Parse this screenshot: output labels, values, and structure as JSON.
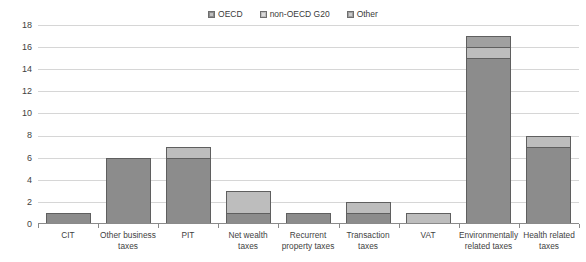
{
  "chart_data": {
    "type": "bar",
    "subtype": "stacked-vertical",
    "title": "",
    "xlabel": "",
    "ylabel": "",
    "ylim": [
      0,
      18
    ],
    "yticks": [
      0,
      2,
      4,
      6,
      8,
      10,
      12,
      14,
      16,
      18
    ],
    "grid": true,
    "legend_position": "top-center",
    "categories": [
      "CIT",
      "Other business taxes",
      "PIT",
      "Net wealth taxes",
      "Recurrent property taxes",
      "Transaction taxes",
      "VAT",
      "Environmentally related taxes",
      "Health related taxes"
    ],
    "series": [
      {
        "name": "OECD",
        "color": "#8c8c8c",
        "values": [
          1,
          6,
          6,
          1,
          1,
          1,
          0,
          15,
          7
        ]
      },
      {
        "name": "non-OECD G20",
        "color": "#bdbdbd",
        "values": [
          0,
          0,
          1,
          2,
          0,
          1,
          1,
          1,
          1
        ]
      },
      {
        "name": "Other",
        "color": "#a0a0a0",
        "values": [
          0,
          0,
          0,
          0,
          0,
          0,
          0,
          1,
          0
        ]
      }
    ],
    "totals": [
      1,
      6,
      7,
      3,
      1,
      2,
      1,
      17,
      8
    ]
  },
  "legend": {
    "items": [
      {
        "label": "OECD"
      },
      {
        "label": "non-OECD G20"
      },
      {
        "label": "Other"
      }
    ]
  },
  "axis": {
    "y_tick_labels": [
      "18",
      "16",
      "14",
      "12",
      "10",
      "8",
      "6",
      "4",
      "2",
      "0"
    ],
    "x_tick_labels": [
      "CIT",
      "Other business taxes",
      "PIT",
      "Net wealth taxes",
      "Recurrent property taxes",
      "Transaction taxes",
      "VAT",
      "Environmentally related taxes",
      "Health related taxes"
    ]
  }
}
